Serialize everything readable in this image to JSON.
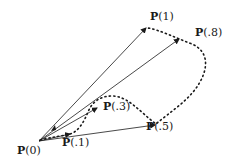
{
  "diagram": {
    "type": "vector-curve",
    "stroke_color": "#1a1a1a",
    "background": "#ffffff",
    "origin": {
      "label_prefix": "P",
      "label_arg": "(0)"
    },
    "points": [
      {
        "id": "p1",
        "label_prefix": "P",
        "label_arg": "(1)"
      },
      {
        "id": "p08",
        "label_prefix": "P",
        "label_arg": "(.8)"
      },
      {
        "id": "p05",
        "label_prefix": "P",
        "label_arg": "(.5)"
      },
      {
        "id": "p03",
        "label_prefix": "P",
        "label_arg": "(.3)"
      },
      {
        "id": "p01",
        "label_prefix": "P",
        "label_arg": "(.1)"
      }
    ]
  }
}
